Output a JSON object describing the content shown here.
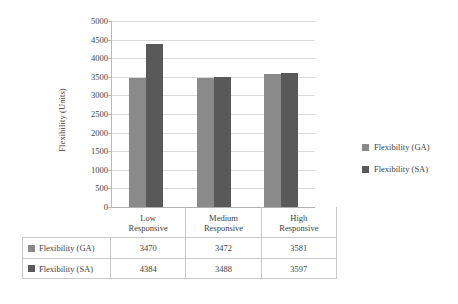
{
  "chart_data": {
    "type": "bar",
    "title": "",
    "xlabel": "",
    "ylabel": "Flexibility (Units)",
    "ylim": [
      0,
      5000
    ],
    "ytick_step": 500,
    "yticks": [
      "5000",
      "4500",
      "4000",
      "3500",
      "3000",
      "2500",
      "2000",
      "1500",
      "1000",
      "500",
      "0"
    ],
    "categories": [
      "Low Responsive",
      "Medium Responsive",
      "High Responsive"
    ],
    "category_lines": [
      {
        "l1": "Low",
        "l2": "Responsive"
      },
      {
        "l1": "Medium",
        "l2": "Responsive"
      },
      {
        "l1": "High",
        "l2": "Responsive"
      }
    ],
    "series": [
      {
        "name": "Flexibility (GA)",
        "color": "#8a8a8a",
        "values": [
          3470,
          3472,
          3581
        ]
      },
      {
        "name": "Flexibility (SA)",
        "color": "#595959",
        "values": [
          4384,
          3488,
          3597
        ]
      }
    ],
    "grid": true,
    "legend_position": "right",
    "data_table_visible": true
  },
  "legend": {
    "items": [
      {
        "label": "Flexibility (GA)",
        "color": "#8a8a8a"
      },
      {
        "label": "Flexibility (SA)",
        "color": "#595959"
      }
    ]
  },
  "data_table": {
    "rows": [
      {
        "label": "Flexibility (GA)",
        "color": "#8a8a8a",
        "values": [
          "3470",
          "3472",
          "3581"
        ]
      },
      {
        "label": "Flexibility (SA)",
        "color": "#595959",
        "values": [
          "4384",
          "3488",
          "3597"
        ]
      }
    ]
  },
  "axis": {
    "y_title": "Flexibility (Units)"
  },
  "colors": {
    "series_ga": "#8a8a8a",
    "series_sa": "#595959",
    "gridline": "#d9d9d9",
    "axis": "#b9b9b9",
    "text": "#3f3f3f",
    "table_border": "#c9c9c9"
  }
}
